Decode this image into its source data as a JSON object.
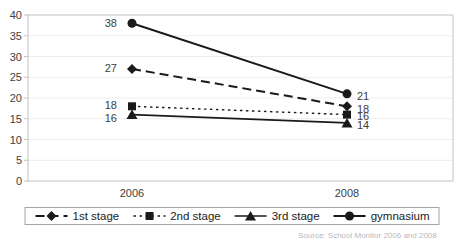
{
  "chart_data": {
    "type": "line",
    "title": "",
    "xlabel": "",
    "ylabel": "",
    "categories": [
      "2006",
      "2008"
    ],
    "series": [
      {
        "name": "1st stage",
        "values": [
          27,
          18
        ],
        "marker": "diamond",
        "dash": "long-dash"
      },
      {
        "name": "2nd stage",
        "values": [
          18,
          16
        ],
        "marker": "square",
        "dash": "short-dash"
      },
      {
        "name": "3rd stage",
        "values": [
          16,
          14
        ],
        "marker": "triangle",
        "dash": "solid"
      },
      {
        "name": "gymnasium",
        "values": [
          38,
          21
        ],
        "marker": "circle",
        "dash": "solid"
      }
    ],
    "ylim": [
      0,
      40
    ],
    "y_ticks": [
      0,
      5,
      10,
      15,
      20,
      25,
      30,
      35,
      40
    ],
    "grid": true,
    "data_labels": true,
    "legend_position": "bottom"
  },
  "colors": {
    "series": "#1a1a1a",
    "grid": "#ececec",
    "plot_border": "#c2c2c2",
    "axis_text": "#404040",
    "legend_border": "#a6a6a6",
    "caption_text": "#b9b9b9"
  },
  "footer": {
    "source": "Source: School Monitor 2006 and 2008"
  }
}
